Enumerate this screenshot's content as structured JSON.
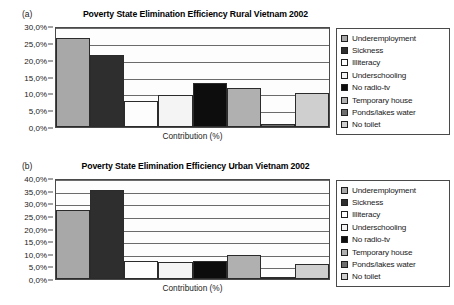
{
  "panels": [
    {
      "tag": "(a)",
      "title": "Poverty State Elimination Efficiency Rural Vietnam 2002",
      "xlabel": "Contribution (%)",
      "yticks": [
        "0,0%",
        "5,0%",
        "10,0%",
        "15,0%",
        "20,0%",
        "25,0%",
        "30,0%"
      ]
    },
    {
      "tag": "(b)",
      "title": "Poverty State Elimination Efficiency Urban Vietnam 2002",
      "xlabel": "Contribution (%)",
      "yticks": [
        "0,0%",
        "5,0%",
        "10,0%",
        "15,0%",
        "20,0%",
        "25,0%",
        "30,0%",
        "35,0%",
        "40,0%"
      ]
    }
  ],
  "legend": {
    "items": [
      {
        "label": "Underemployment",
        "color": "#a8a8a8"
      },
      {
        "label": "Sickness",
        "color": "#2e2e2e"
      },
      {
        "label": "Illiteracy",
        "color": "#fdfdfd"
      },
      {
        "label": "Underschooling",
        "color": "#f4f4f4"
      },
      {
        "label": "No radio-tv",
        "color": "#0d0d0d"
      },
      {
        "label": "Temporary house",
        "color": "#b0b0b0"
      },
      {
        "label": "Ponds/lakes water",
        "color": "#6e6e6e"
      },
      {
        "label": "No toilet",
        "color": "#cfcfcf"
      }
    ]
  },
  "chart_data": [
    {
      "type": "bar",
      "title": "Poverty State Elimination Efficiency Rural Vietnam 2002",
      "xlabel": "Contribution (%)",
      "ylabel": "",
      "ylim": [
        0,
        30
      ],
      "ytick_values": [
        0,
        5,
        10,
        15,
        20,
        25,
        30
      ],
      "grid": true,
      "legend_position": "right",
      "categories": [
        "Underemployment",
        "Sickness",
        "Illiteracy",
        "Underschooling",
        "No radio-tv",
        "Temporary house",
        "Ponds/lakes water",
        "No toilet"
      ],
      "values": [
        26.5,
        21.4,
        7.6,
        9.4,
        13.0,
        11.5,
        1.0,
        10.0
      ],
      "colors": [
        "#a8a8a8",
        "#2e2e2e",
        "#fdfdfd",
        "#f4f4f4",
        "#0d0d0d",
        "#b0b0b0",
        "#6e6e6e",
        "#cfcfcf"
      ]
    },
    {
      "type": "bar",
      "title": "Poverty State Elimination Efficiency Urban Vietnam 2002",
      "xlabel": "Contribution (%)",
      "ylabel": "",
      "ylim": [
        0,
        40
      ],
      "ytick_values": [
        0,
        5,
        10,
        15,
        20,
        25,
        30,
        35,
        40
      ],
      "grid": true,
      "legend_position": "right",
      "categories": [
        "Underemployment",
        "Sickness",
        "Illiteracy",
        "Underschooling",
        "No radio-tv",
        "Temporary house",
        "Ponds/lakes water",
        "No toilet"
      ],
      "values": [
        27.3,
        35.3,
        7.0,
        6.8,
        7.2,
        9.5,
        0.6,
        6.1
      ],
      "colors": [
        "#a8a8a8",
        "#2e2e2e",
        "#fdfdfd",
        "#f4f4f4",
        "#0d0d0d",
        "#b0b0b0",
        "#6e6e6e",
        "#cfcfcf"
      ]
    }
  ]
}
